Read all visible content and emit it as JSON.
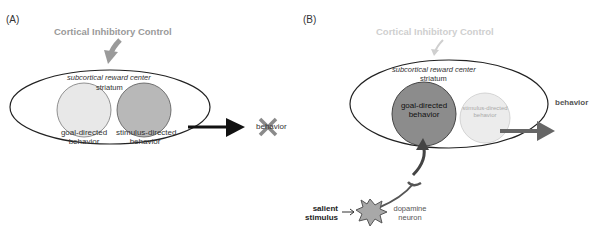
{
  "panels": {
    "A": {
      "label": "(A)",
      "control_label": "Cortical Inhibitory Control",
      "region_label": "subcortical reward center",
      "structure_label": "striatum",
      "circles": [
        {
          "label_line1": "goal-directed",
          "label_line2": "behavior",
          "fill": "#e8e8e8"
        },
        {
          "label_line1": "stimulus-directed",
          "label_line2": "behavior",
          "fill": "#b8b8b8"
        }
      ],
      "output_label": "behavior",
      "output_state": "blocked"
    },
    "B": {
      "label": "(B)",
      "control_label": "Cortical Inhibitory Control",
      "region_label": "subcortical reward center",
      "structure_label": "striatum",
      "circles": [
        {
          "label_line1": "goal-directed",
          "label_line2": "behavior",
          "fill": "#8c8c8c"
        },
        {
          "label_line1": "stimulus-directed",
          "label_line2": "behavior",
          "fill": "#ececec"
        }
      ],
      "output_label": "behavior",
      "input_label_line1": "salient",
      "input_label_line2": "stimulus",
      "neuron_label_line1": "dopamine",
      "neuron_label_line2": "neuron"
    }
  },
  "colors": {
    "control_A": "#9a9a9a",
    "control_B": "#cfcfcf",
    "cross": "#8a8a8a",
    "arrow_A": "#111111",
    "arrow_B": "#666666",
    "neuron": "#a8a8a8"
  }
}
